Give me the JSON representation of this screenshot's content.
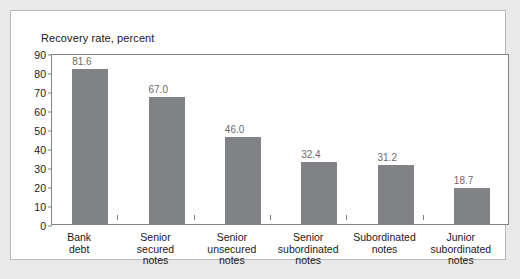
{
  "panel": {
    "background": "#ffffff",
    "border_color": "#b9b9b9"
  },
  "page": {
    "background": "#e9e9e9"
  },
  "chart_data": {
    "type": "bar",
    "title": "Recovery rate, percent",
    "xlabel": "",
    "ylabel": "",
    "ylim": [
      0,
      90
    ],
    "ytick_step": 10,
    "yticks": [
      "90",
      "80",
      "70",
      "60",
      "50",
      "40",
      "30",
      "20",
      "10",
      "0"
    ],
    "grid": false,
    "legend": "none",
    "bar_color": "#808285",
    "label_color": "#6b6b6b",
    "categories": [
      "Bank debt",
      "Senior secured notes",
      "Senior unsecured notes",
      "Senior subordinated notes",
      "Subordinated notes",
      "Junior subordinated notes"
    ],
    "category_lines": [
      [
        "Bank",
        "debt"
      ],
      [
        "Senior",
        "secured",
        "notes"
      ],
      [
        "Senior",
        "unsecured",
        "notes"
      ],
      [
        "Senior",
        "subordinated",
        "notes"
      ],
      [
        "Subordinated",
        "notes"
      ],
      [
        "Junior",
        "subordinated",
        "notes"
      ]
    ],
    "values": [
      81.6,
      67.0,
      46.0,
      32.4,
      31.2,
      18.7
    ],
    "value_labels": [
      "81.6",
      "67.0",
      "46.0",
      "32.4",
      "31.2",
      "18.7"
    ]
  }
}
